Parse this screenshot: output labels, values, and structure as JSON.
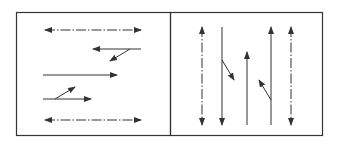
{
  "diagram": {
    "colors": {
      "stroke": "#333333",
      "background": "#ffffff"
    },
    "panels": [
      {
        "id": "horizontal",
        "box": {
          "x": 16,
          "y": 12,
          "w": 154,
          "h": 123
        },
        "lines": [
          {
            "type": "dashdot-double",
            "x1": 45,
            "y1": 30,
            "x2": 141,
            "y2": 30
          },
          {
            "type": "solid-arrow",
            "x1": 141,
            "y1": 49,
            "x2": 93,
            "y2": 49
          },
          {
            "type": "solid-arrow",
            "x1": 130,
            "y1": 49,
            "x2": 110,
            "y2": 61
          },
          {
            "type": "solid-arrow",
            "x1": 43,
            "y1": 75,
            "x2": 117,
            "y2": 75
          },
          {
            "type": "solid-arrow",
            "x1": 43,
            "y1": 99,
            "x2": 91,
            "y2": 99
          },
          {
            "type": "solid-arrow",
            "x1": 55,
            "y1": 99,
            "x2": 75,
            "y2": 87
          },
          {
            "type": "dashdot-double",
            "x1": 45,
            "y1": 120,
            "x2": 141,
            "y2": 120
          }
        ]
      },
      {
        "id": "vertical",
        "box": {
          "x": 170,
          "y": 12,
          "w": 152,
          "h": 123
        },
        "lines": [
          {
            "type": "dashdot-double",
            "x1": 202,
            "y1": 27,
            "x2": 202,
            "y2": 125
          },
          {
            "type": "solid-arrow",
            "x1": 222,
            "y1": 27,
            "x2": 222,
            "y2": 125
          },
          {
            "type": "solid-arrow",
            "x1": 222,
            "y1": 60,
            "x2": 234,
            "y2": 80
          },
          {
            "type": "solid-arrow",
            "x1": 247,
            "y1": 125,
            "x2": 247,
            "y2": 52
          },
          {
            "type": "solid-arrow",
            "x1": 271,
            "y1": 125,
            "x2": 271,
            "y2": 27
          },
          {
            "type": "solid-arrow",
            "x1": 271,
            "y1": 100,
            "x2": 259,
            "y2": 80
          },
          {
            "type": "dashdot-double",
            "x1": 291,
            "y1": 27,
            "x2": 291,
            "y2": 125
          }
        ]
      }
    ]
  }
}
